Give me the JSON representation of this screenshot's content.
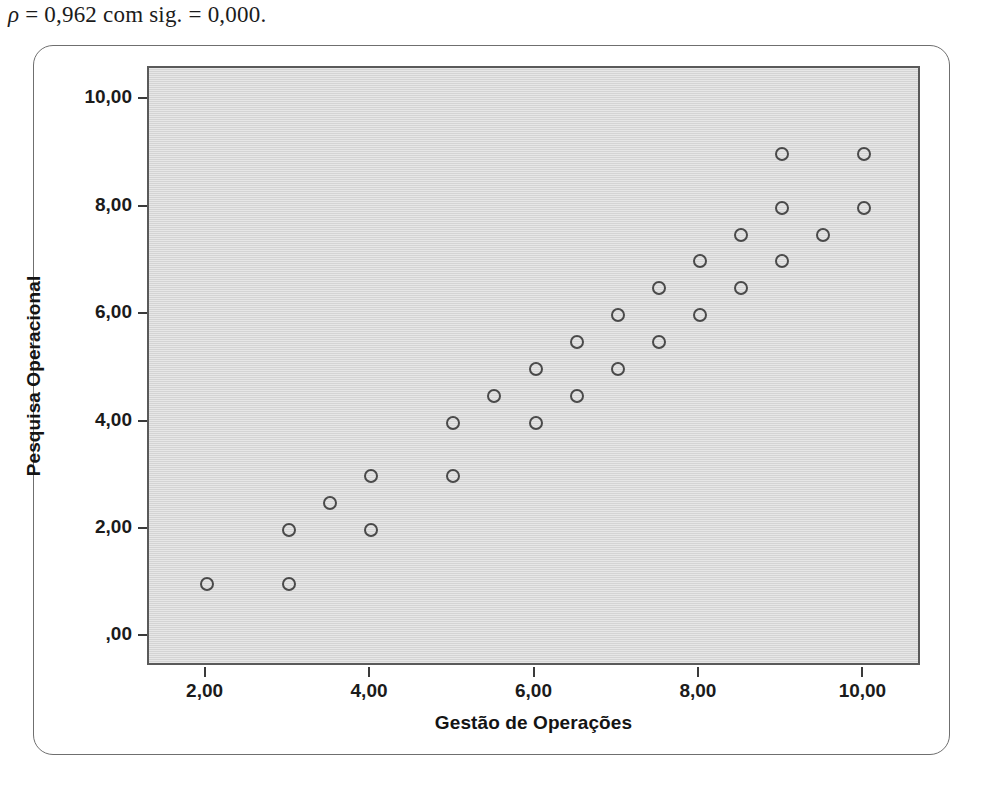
{
  "caption": {
    "rho_symbol": "ρ",
    "text": " = 0,962 com sig. = 0,000."
  },
  "chart_data": {
    "type": "scatter",
    "title": "",
    "xlabel": "Gestão de Operações",
    "ylabel": "Pesquisa Operacional",
    "xlim": [
      1.3,
      10.7
    ],
    "ylim": [
      -0.55,
      10.6
    ],
    "grid": false,
    "legend": null,
    "x_ticks": [
      2,
      4,
      6,
      8,
      10
    ],
    "x_tick_labels": [
      "2,00",
      "4,00",
      "6,00",
      "8,00",
      "10,00"
    ],
    "y_ticks": [
      0,
      2,
      4,
      6,
      8,
      10
    ],
    "y_tick_labels": [
      ",00",
      "2,00",
      "4,00",
      "6,00",
      "8,00",
      "10,00"
    ],
    "marker": "open-circle",
    "marker_color": "#4a4a4a",
    "panel_color": "#d9d9d9",
    "points": [
      {
        "x": 2.0,
        "y": 1.0
      },
      {
        "x": 3.0,
        "y": 1.0
      },
      {
        "x": 3.0,
        "y": 2.0
      },
      {
        "x": 3.5,
        "y": 2.5
      },
      {
        "x": 4.0,
        "y": 2.0
      },
      {
        "x": 4.0,
        "y": 3.0
      },
      {
        "x": 5.0,
        "y": 3.0
      },
      {
        "x": 5.0,
        "y": 4.0
      },
      {
        "x": 5.5,
        "y": 4.5
      },
      {
        "x": 6.0,
        "y": 4.0
      },
      {
        "x": 6.0,
        "y": 5.0
      },
      {
        "x": 6.5,
        "y": 4.5
      },
      {
        "x": 6.5,
        "y": 5.5
      },
      {
        "x": 7.0,
        "y": 5.0
      },
      {
        "x": 7.0,
        "y": 6.0
      },
      {
        "x": 7.5,
        "y": 5.5
      },
      {
        "x": 7.5,
        "y": 6.5
      },
      {
        "x": 8.0,
        "y": 6.0
      },
      {
        "x": 8.0,
        "y": 7.0
      },
      {
        "x": 8.5,
        "y": 6.5
      },
      {
        "x": 8.5,
        "y": 7.5
      },
      {
        "x": 9.0,
        "y": 7.0
      },
      {
        "x": 9.0,
        "y": 8.0
      },
      {
        "x": 9.0,
        "y": 9.0
      },
      {
        "x": 9.5,
        "y": 7.5
      },
      {
        "x": 10.0,
        "y": 8.0
      },
      {
        "x": 10.0,
        "y": 9.0
      }
    ]
  }
}
